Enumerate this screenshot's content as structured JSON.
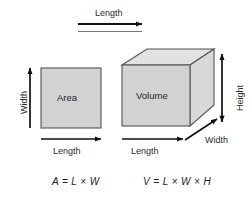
{
  "diagram": {
    "colors": {
      "front_face_fill": "#d2d2d2",
      "top_face_fill": "#e2e2e2",
      "side_face_fill": "#d8d8d8",
      "square_fill": "#d2d2d2",
      "stroke": "#555555",
      "arrow": "#111111",
      "background": "#ffffff",
      "text": "#1f1f1f"
    },
    "top_measure": {
      "label": "Length"
    },
    "square": {
      "face_label": "Area",
      "width_label": "Width",
      "length_label": "Length",
      "formula": "A = L × W"
    },
    "box": {
      "face_label": "Volume",
      "height_label": "Height",
      "width_label": "Width",
      "length_label": "Length",
      "formula": "V = L × W × H"
    }
  }
}
